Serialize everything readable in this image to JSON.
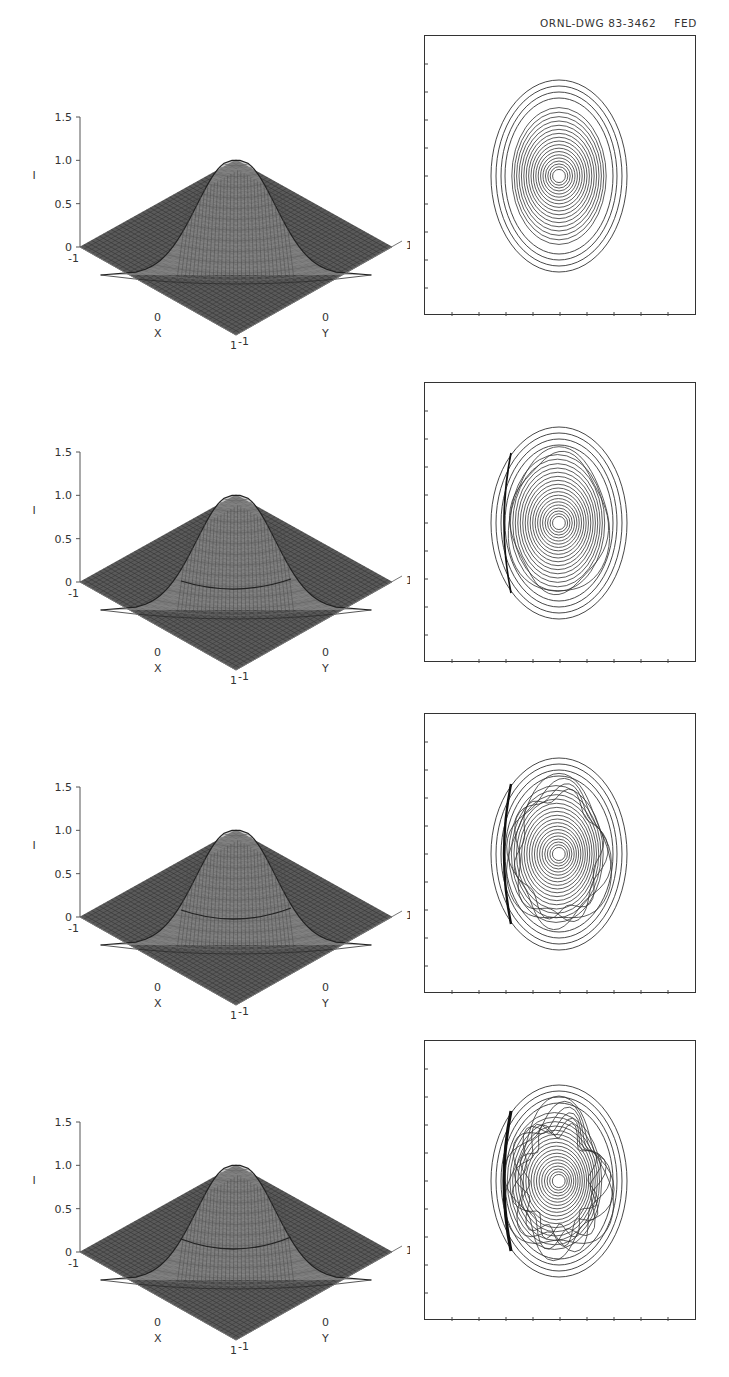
{
  "header": {
    "drawing_number": "ORNL-DWG 83-3462",
    "suffix": "FED"
  },
  "axes": {
    "z_label": "I",
    "z_ticks": [
      "0",
      "0.5",
      "1.0",
      "1.5"
    ],
    "x_label": "X",
    "y_label": "Y",
    "x_ticks": [
      "-1",
      "0",
      "1"
    ],
    "y_ticks": [
      "-1",
      "0",
      "1"
    ]
  },
  "panels": [
    {
      "row": 1,
      "peak": 1.0,
      "ring_perturbation": "none"
    },
    {
      "row": 2,
      "peak": 1.0,
      "ring_perturbation": "small"
    },
    {
      "row": 3,
      "peak": 1.0,
      "ring_perturbation": "moderate"
    },
    {
      "row": 4,
      "peak": 1.0,
      "ring_perturbation": "large"
    }
  ],
  "chart_data": [
    {
      "type": "surface",
      "title": "",
      "xlabel": "X",
      "ylabel": "Y",
      "zlabel": "I",
      "xlim": [
        -1,
        1
      ],
      "ylim": [
        -1,
        1
      ],
      "zlim": [
        0,
        1.5
      ],
      "z_ticks": [
        0,
        0.5,
        1.0,
        1.5
      ],
      "description": "Gaussian-like peaked surface, max I ≈ 1.0 at center"
    },
    {
      "type": "contour",
      "description": "Nested elliptical contours, smooth"
    },
    {
      "type": "surface",
      "xlabel": "X",
      "ylabel": "Y",
      "zlabel": "I",
      "xlim": [
        -1,
        1
      ],
      "ylim": [
        -1,
        1
      ],
      "zlim": [
        0,
        1.5
      ],
      "description": "Peaked surface with slight shoulder, max I ≈ 1.0"
    },
    {
      "type": "contour",
      "description": "Elliptical contours with wavy outer ring"
    },
    {
      "type": "surface",
      "xlabel": "X",
      "ylabel": "Y",
      "zlabel": "I",
      "xlim": [
        -1,
        1
      ],
      "ylim": [
        -1,
        1
      ],
      "zlim": [
        0,
        1.5
      ],
      "description": "Peaked surface with stronger shoulder, max I ≈ 1.0"
    },
    {
      "type": "contour",
      "description": "Elliptical contours with stronger distortion"
    },
    {
      "type": "surface",
      "xlabel": "X",
      "ylabel": "Y",
      "zlabel": "I",
      "xlim": [
        -1,
        1
      ],
      "ylim": [
        -1,
        1
      ],
      "zlim": [
        0,
        1.5
      ],
      "description": "Peaked surface with pronounced side lobes, max I ≈ 1.0"
    },
    {
      "type": "contour",
      "description": "Strongly distorted contours with island structures"
    }
  ]
}
